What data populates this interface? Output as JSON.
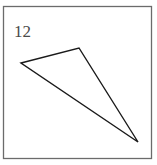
{
  "figure": {
    "label": "12",
    "label_color": "#4a4a4a",
    "label_font_size": 17,
    "label_x": 14,
    "label_baseline_y": 37,
    "background_color": "#ffffff"
  },
  "frame": {
    "name": "figure-border",
    "x": 3.5,
    "y": 6.5,
    "width": 148,
    "height": 152,
    "stroke_color": "#6b6b6b",
    "stroke_width": 1.3
  },
  "chart_data": {
    "type": "scatter",
    "title": "12",
    "subtitle": "",
    "xlabel": "",
    "ylabel": "",
    "grid": false,
    "legend_position": "none",
    "annotations": [
      {
        "text": "12",
        "x": 14,
        "y": 37,
        "role": "figure-number"
      }
    ],
    "shapes": [
      {
        "name": "triangle",
        "kind": "polygon",
        "closed": true,
        "fill": "none",
        "stroke": "#1a1a1a",
        "stroke_width": 1.4,
        "vertices": [
          {
            "label": "left-vertex",
            "x": 21,
            "y": 63
          },
          {
            "label": "top-vertex",
            "x": 79,
            "y": 48
          },
          {
            "label": "bottom-right-vertex",
            "x": 138,
            "y": 142
          }
        ],
        "edges": [
          {
            "from": "left-vertex",
            "to": "top-vertex"
          },
          {
            "from": "top-vertex",
            "to": "bottom-right-vertex"
          },
          {
            "from": "bottom-right-vertex",
            "to": "left-vertex"
          }
        ]
      }
    ],
    "axis_visible": false,
    "xlim": [
      0,
      157
    ],
    "ylim": [
      0,
      165
    ]
  }
}
